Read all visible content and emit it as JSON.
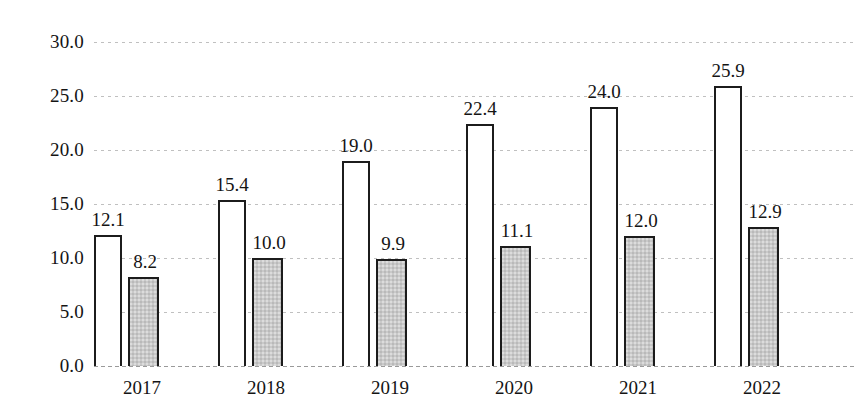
{
  "chart_data": {
    "type": "bar",
    "title": "",
    "subtitle": "",
    "xlabel": "",
    "ylabel": "",
    "categories": [
      "2017",
      "2018",
      "2019",
      "2020",
      "2021",
      "2022"
    ],
    "series": [
      {
        "name": "series-1",
        "style": "white-outlined",
        "values": [
          12.1,
          15.4,
          19.0,
          22.4,
          24.0,
          25.9
        ],
        "labels": [
          "12.1",
          "15.4",
          "19.0",
          "22.4",
          "24.0",
          "25.9"
        ]
      },
      {
        "name": "series-2",
        "style": "gray-filled",
        "values": [
          8.2,
          10.0,
          9.9,
          11.1,
          12.0,
          12.9
        ],
        "labels": [
          "8.2",
          "10.0",
          "9.9",
          "11.1",
          "12.0",
          "12.9"
        ]
      }
    ],
    "ylim": [
      0.0,
      30.0
    ],
    "ytick_values": [
      0.0,
      5.0,
      10.0,
      15.0,
      20.0,
      25.0,
      30.0
    ],
    "ytick_labels": [
      "0.0",
      "5.0",
      "10.0",
      "15.0",
      "20.0",
      "25.0",
      "30.0"
    ],
    "grid": true,
    "grid_style": "dotted-horizontal",
    "legend": "none",
    "data_labels": true,
    "colors": {
      "series_1_fill": "#ffffff",
      "series_1_stroke": "#1c1c1c",
      "series_2_fill": "#c9c9c9",
      "series_2_stroke": "#1c1c1c",
      "gridline": "#8c8c8c",
      "text": "#141414",
      "background": "#ffffff"
    }
  }
}
